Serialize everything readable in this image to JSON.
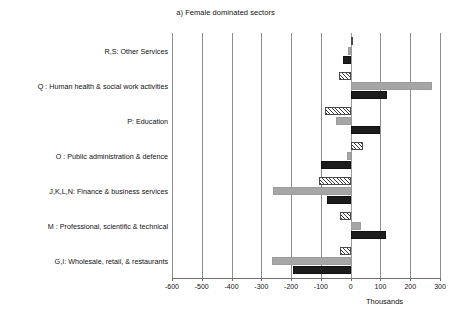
{
  "chart_data": {
    "type": "bar",
    "orientation": "horizontal",
    "title": "a) Female dominated sectors",
    "xlabel": "Thousands",
    "ylabel": "",
    "xlim": [
      -600,
      300
    ],
    "xticks": [
      -600,
      -500,
      -400,
      -300,
      -200,
      -100,
      0,
      100,
      200,
      300
    ],
    "xticklabels": [
      "-600",
      "-500",
      "-400",
      "-300",
      "-200",
      "-100",
      "0",
      "100",
      "200",
      "300"
    ],
    "grid": true,
    "legend": false,
    "categories": [
      "R,S: Other Services",
      "Q : Human health & social work activities",
      "P: Education",
      "O : Public administration & defence",
      "J,K,L,N: Finance & business services",
      "M : Professional, scientific & technical",
      "G,I: Wholesale, retail, & restaurants"
    ],
    "series": [
      {
        "name": "series-1",
        "style": "hatched",
        "color": "#ffffff",
        "values": [
          5,
          -38,
          -85,
          42,
          -105,
          -35,
          -35
        ]
      },
      {
        "name": "series-2",
        "style": "gray",
        "color": "#a6a6a6",
        "values": [
          -10,
          272,
          -50,
          -12,
          -260,
          35,
          -265
        ]
      },
      {
        "name": "series-3",
        "style": "black",
        "color": "#1c1c1c",
        "values": [
          -25,
          122,
          100,
          -100,
          -80,
          120,
          -195
        ]
      }
    ]
  },
  "axis": {
    "units_label": "Thousands"
  },
  "colors": {
    "gridline": "#8d8d8d",
    "axis": "#6f6f6f",
    "gray_series": "#a6a6a6",
    "black_series": "#1c1c1c",
    "hatch_stroke": "#3c3c3c",
    "background": "#ffffff"
  }
}
